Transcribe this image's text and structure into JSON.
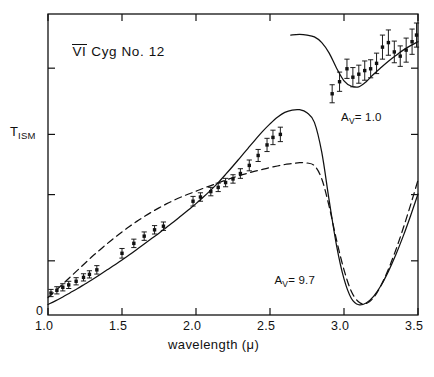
{
  "figure": {
    "title": "VI Cyg No. 12",
    "title_overline_part": "VI",
    "title_rest": " Cyg  No. 12",
    "origin_label": "0"
  },
  "axes": {
    "x": {
      "label_text": "wavelength (μ)",
      "label_prefix": "wavelength (",
      "label_symbol": "μ",
      "label_suffix": ")",
      "min": 1.0,
      "max": 3.5,
      "ticks": [
        1.0,
        1.5,
        2.0,
        2.5,
        3.0,
        3.5
      ],
      "ticklabels": [
        "1.0",
        "1.5",
        "2.0",
        "2.5",
        "3.0",
        "3.5"
      ],
      "tick_direction": "in",
      "mirrored_top": true
    },
    "y": {
      "label_text": "T_ISM",
      "label_main": "T",
      "label_sub": "ISM",
      "min": 0.0,
      "max": 1.0,
      "ticks": [
        0.18,
        0.4,
        0.6,
        0.82
      ],
      "ticklabels": [
        "",
        "",
        "",
        ""
      ],
      "tick_direction": "in",
      "mirrored_right": true
    }
  },
  "annotations": [
    {
      "name": "av-1-0",
      "text": "A_V= 1.0",
      "main": "A",
      "sub": "V",
      "rest": "= 1.0",
      "x": 2.98,
      "y": 0.655
    },
    {
      "name": "av-9-7",
      "text": "A_V= 9.7",
      "main": "A",
      "sub": "V",
      "rest": "= 9.7",
      "x": 2.53,
      "y": 0.112
    }
  ],
  "colors": {
    "ink": "#111111",
    "background": "#ffffff",
    "curve_solid": "#111111",
    "curve_dashed": "#111111"
  },
  "chart_data": {
    "type": "line",
    "title": "VI Cyg No. 12",
    "xlabel": "wavelength (μ)",
    "ylabel": "T_ISM",
    "xlim": [
      1.0,
      3.5
    ],
    "ylim": [
      0.0,
      1.0
    ],
    "grid": false,
    "legend": "none",
    "annotations_in_plot": [
      "A_V= 1.0",
      "A_V= 9.7"
    ],
    "series": [
      {
        "name": "model-solid-av9.7",
        "style": "solid",
        "group": "A_V=9.7",
        "x": [
          1.0,
          1.05,
          1.1,
          1.15,
          1.2,
          1.25,
          1.3,
          1.35,
          1.4,
          1.45,
          1.5,
          1.55,
          1.6,
          1.65,
          1.7,
          1.75,
          1.8,
          1.85,
          1.9,
          1.95,
          2.0,
          2.05,
          2.1,
          2.15,
          2.2,
          2.25,
          2.3,
          2.35,
          2.4,
          2.45,
          2.5,
          2.55,
          2.6,
          2.65,
          2.7,
          2.75,
          2.8,
          2.85,
          2.9,
          2.95,
          3.0,
          3.05,
          3.1,
          3.15,
          3.2,
          3.25,
          3.3,
          3.35,
          3.4,
          3.45,
          3.5
        ],
        "y": [
          0.035,
          0.047,
          0.06,
          0.074,
          0.088,
          0.103,
          0.118,
          0.134,
          0.15,
          0.166,
          0.183,
          0.2,
          0.218,
          0.236,
          0.254,
          0.272,
          0.291,
          0.31,
          0.33,
          0.35,
          0.37,
          0.392,
          0.415,
          0.44,
          0.467,
          0.495,
          0.524,
          0.553,
          0.582,
          0.61,
          0.635,
          0.657,
          0.673,
          0.681,
          0.682,
          0.672,
          0.64,
          0.54,
          0.38,
          0.23,
          0.12,
          0.055,
          0.034,
          0.04,
          0.062,
          0.098,
          0.145,
          0.2,
          0.262,
          0.33,
          0.402
        ]
      },
      {
        "name": "model-dashed-av9.7",
        "style": "dashed",
        "group": "A_V=9.7",
        "x": [
          1.0,
          1.05,
          1.1,
          1.15,
          1.2,
          1.25,
          1.3,
          1.35,
          1.4,
          1.45,
          1.5,
          1.55,
          1.6,
          1.65,
          1.7,
          1.75,
          1.8,
          1.85,
          1.9,
          1.95,
          2.0,
          2.05,
          2.1,
          2.15,
          2.2,
          2.25,
          2.3,
          2.35,
          2.4,
          2.45,
          2.5,
          2.55,
          2.6,
          2.65,
          2.7,
          2.75,
          2.8,
          2.85,
          2.9,
          2.95,
          3.0,
          3.05,
          3.1,
          3.15,
          3.2,
          3.25,
          3.3,
          3.35,
          3.4,
          3.45,
          3.5
        ],
        "y": [
          0.058,
          0.08,
          0.103,
          0.126,
          0.149,
          0.172,
          0.195,
          0.216,
          0.237,
          0.257,
          0.276,
          0.294,
          0.311,
          0.327,
          0.342,
          0.356,
          0.369,
          0.381,
          0.392,
          0.402,
          0.411,
          0.421,
          0.43,
          0.439,
          0.448,
          0.456,
          0.464,
          0.471,
          0.478,
          0.484,
          0.49,
          0.495,
          0.5,
          0.503,
          0.506,
          0.505,
          0.496,
          0.452,
          0.36,
          0.248,
          0.15,
          0.078,
          0.043,
          0.038,
          0.058,
          0.098,
          0.152,
          0.216,
          0.288,
          0.366,
          0.448
        ]
      },
      {
        "name": "model-solid-av1.0",
        "style": "solid",
        "group": "A_V=1.0",
        "x": [
          2.64,
          2.7,
          2.75,
          2.8,
          2.85,
          2.9,
          2.95,
          3.0,
          3.05,
          3.1,
          3.15,
          3.2,
          3.25,
          3.3,
          3.35,
          3.4,
          3.45,
          3.5
        ],
        "y": [
          0.93,
          0.932,
          0.93,
          0.924,
          0.905,
          0.87,
          0.82,
          0.778,
          0.76,
          0.758,
          0.775,
          0.8,
          0.822,
          0.843,
          0.862,
          0.88,
          0.895,
          0.908
        ]
      }
    ],
    "points": [
      {
        "name": "observed-av9.7",
        "group": "A_V=9.7",
        "marker": "square",
        "x": [
          1.02,
          1.06,
          1.1,
          1.14,
          1.19,
          1.24,
          1.28,
          1.33,
          1.5,
          1.58,
          1.65,
          1.72,
          1.78,
          1.98,
          2.03,
          2.1,
          2.15,
          2.2,
          2.25,
          2.3,
          2.36,
          2.42,
          2.48,
          2.52,
          2.57
        ],
        "y": [
          0.073,
          0.082,
          0.092,
          0.1,
          0.112,
          0.125,
          0.135,
          0.15,
          0.205,
          0.238,
          0.262,
          0.283,
          0.295,
          0.378,
          0.392,
          0.41,
          0.424,
          0.44,
          0.452,
          0.47,
          0.497,
          0.53,
          0.565,
          0.59,
          0.6
        ],
        "yerr": [
          0.012,
          0.012,
          0.012,
          0.012,
          0.012,
          0.012,
          0.012,
          0.014,
          0.016,
          0.014,
          0.014,
          0.014,
          0.014,
          0.016,
          0.014,
          0.014,
          0.014,
          0.014,
          0.014,
          0.016,
          0.018,
          0.02,
          0.022,
          0.024,
          0.024
        ]
      },
      {
        "name": "observed-av1.0",
        "group": "A_V=1.0",
        "marker": "square",
        "x": [
          2.92,
          2.97,
          3.02,
          3.06,
          3.1,
          3.14,
          3.18,
          3.22,
          3.26,
          3.3,
          3.34,
          3.38,
          3.42,
          3.46,
          3.49
        ],
        "y": [
          0.735,
          0.775,
          0.818,
          0.79,
          0.8,
          0.812,
          0.818,
          0.836,
          0.89,
          0.905,
          0.874,
          0.86,
          0.88,
          0.908,
          0.93
        ],
        "yerr": [
          0.03,
          0.032,
          0.032,
          0.032,
          0.03,
          0.032,
          0.03,
          0.034,
          0.04,
          0.042,
          0.036,
          0.034,
          0.04,
          0.042,
          0.04
        ]
      }
    ]
  }
}
